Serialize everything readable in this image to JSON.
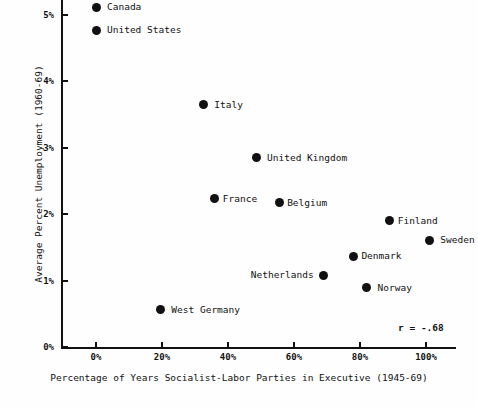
{
  "chart_data": {
    "type": "scatter",
    "title": "",
    "xlabel": "Percentage of Years Socialist-Labor Parties in Executive (1945-69)",
    "ylabel": "Average Percent Unemployment (1960-69)",
    "xlim": [
      -14,
      106
    ],
    "ylim": [
      0,
      5.25
    ],
    "xticks": [
      "0%",
      "20%",
      "40%",
      "60%",
      "80%",
      "100%"
    ],
    "xtick_values": [
      0,
      20,
      40,
      60,
      80,
      100
    ],
    "yticks": [
      "0%",
      "1%",
      "2%",
      "3%",
      "4%",
      "5%"
    ],
    "ytick_values": [
      0,
      1,
      2,
      3,
      4,
      5
    ],
    "grid": false,
    "legend": "none",
    "annotations": [
      {
        "name": "correlation",
        "text": "r = -.68"
      }
    ],
    "points": [
      {
        "label": "Canada",
        "x": 0,
        "y": 5.12,
        "label_side": "right"
      },
      {
        "label": "United States",
        "x": 0,
        "y": 4.77,
        "label_side": "right"
      },
      {
        "label": "Italy",
        "x": 32.5,
        "y": 3.65,
        "label_side": "right"
      },
      {
        "label": "United Kingdom",
        "x": 48.5,
        "y": 2.85,
        "label_side": "right"
      },
      {
        "label": "France",
        "x": 36,
        "y": 2.23,
        "label_side": "right"
      },
      {
        "label": "Belgium",
        "x": 55.5,
        "y": 2.17,
        "label_side": "right"
      },
      {
        "label": "Finland",
        "x": 89,
        "y": 1.9,
        "label_side": "right"
      },
      {
        "label": "Sweden",
        "x": 101,
        "y": 1.61,
        "label_side": "right"
      },
      {
        "label": "Denmark",
        "x": 78,
        "y": 1.37,
        "label_side": "right"
      },
      {
        "label": "Netherlands",
        "x": 69,
        "y": 1.08,
        "label_side": "left"
      },
      {
        "label": "Norway",
        "x": 82,
        "y": 0.89,
        "label_side": "right"
      },
      {
        "label": "West Germany",
        "x": 19.5,
        "y": 0.56,
        "label_side": "right"
      }
    ]
  }
}
